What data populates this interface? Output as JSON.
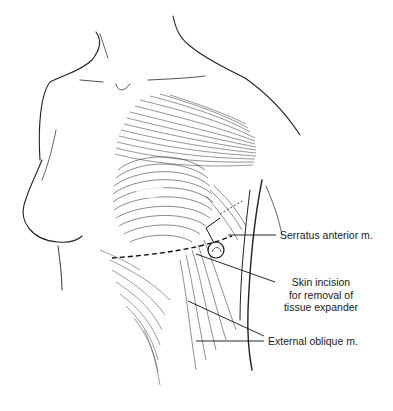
{
  "figure": {
    "type": "anatomical illustration",
    "labels": [
      {
        "id": "serratus",
        "text": "Serratus anterior m."
      },
      {
        "id": "incision",
        "lines": [
          "Skin incision",
          "for removal of",
          "tissue expander"
        ]
      },
      {
        "id": "oblique",
        "text": "External oblique m."
      }
    ]
  },
  "colors": {
    "ink": "#1a1a1a",
    "background": "#ffffff"
  }
}
